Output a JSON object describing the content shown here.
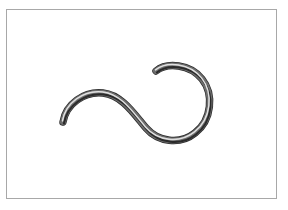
{
  "figure": {
    "title": "Shaded tube curve",
    "background_color": "#ffffff",
    "frame": {
      "name": "image-border",
      "color": "#a8a8a8",
      "x": 6,
      "y": 9,
      "width": 271,
      "height": 190,
      "line_width": 1
    },
    "object": {
      "name": "shaded-tube-curve",
      "description": "Continuous S-shaped tube that terminates in an open circular hook on the right",
      "tube_width": 6,
      "colors": {
        "edge_dark": "#3a3a3a",
        "body_mid": "#6e6e6e",
        "highlight": "#d8d8d8",
        "shadow": "#2b2b2b",
        "outline": "#2a2a2a"
      },
      "path": "M 63 122 C 66 104, 84 91, 103 93 C 122 95, 134 114, 146 128 C 158 142, 180 145, 195 133 C 212 120, 214 94, 202 79 C 190 64, 167 62, 156 71",
      "endpoints": {
        "left_tip": {
          "x": 63,
          "y": 122
        },
        "right_tip": {
          "x": 156,
          "y": 71
        }
      },
      "extents": {
        "left": 63,
        "right": 213,
        "top": 68,
        "bottom": 142
      }
    }
  }
}
